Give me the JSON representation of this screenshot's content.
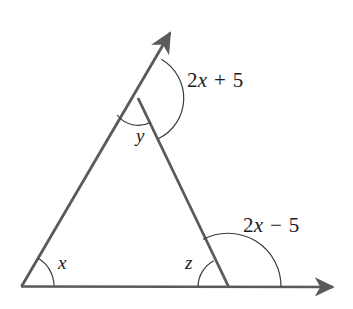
{
  "figure": {
    "type": "geometry-diagram",
    "background_color": "#ffffff",
    "line_color": "#5a5a5a",
    "arc_color": "#3a3a3a",
    "text_color": "#1a1a1a"
  },
  "labels": {
    "angle_x": "x",
    "angle_y": "y",
    "angle_z": "z",
    "exterior_top": {
      "coefficient": "2",
      "variable": "x",
      "operator": "+",
      "constant": "5",
      "full": "2x + 5"
    },
    "exterior_bottom": {
      "coefficient": "2",
      "variable": "x",
      "operator": "−",
      "constant": "5",
      "full": "2x − 5"
    }
  },
  "geometry": {
    "vertices": {
      "left": [
        22,
        286
      ],
      "right": [
        228,
        286
      ],
      "apex": [
        138,
        98
      ]
    },
    "rays": {
      "upper_ray_tip": [
        176,
        25
      ],
      "baseline_right_tip": [
        341,
        287
      ]
    },
    "arcs": {
      "x_radius": 32,
      "y_radius": 27,
      "top_exterior_radius": 45,
      "z_radius": 30,
      "bottom_exterior_radius": 53
    }
  }
}
